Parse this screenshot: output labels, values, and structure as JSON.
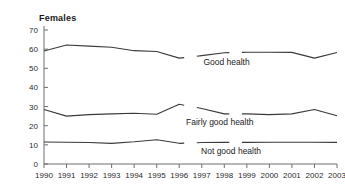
{
  "chart_data": {
    "type": "line",
    "title": "Females",
    "xlabel": "",
    "ylabel": "",
    "x": [
      1990,
      1991,
      1992,
      1993,
      1994,
      1995,
      1996,
      1997,
      1998,
      1999,
      2000,
      2001,
      2002,
      2003
    ],
    "categories": [
      "1990",
      "1991",
      "1992",
      "1993",
      "1994",
      "1995",
      "1996",
      "1997",
      "1998",
      "1999",
      "2000",
      "2001",
      "2002",
      "2003"
    ],
    "ylim": [
      0,
      70
    ],
    "yticks": [
      0,
      10,
      20,
      30,
      40,
      50,
      60,
      70
    ],
    "ytick_labels": [
      "0",
      "10",
      "20",
      "30",
      "40",
      "50",
      "60",
      "70"
    ],
    "grid": false,
    "legend_position": "inline-annotations",
    "series": [
      {
        "name": "Good health",
        "label": "Good health",
        "values": [
          59,
          62.2,
          61.6,
          61,
          59.2,
          58.8,
          55.3,
          56.6,
          58.1,
          58.4,
          58.4,
          58.3,
          55.3,
          58.2
        ],
        "breaks_after": [
          1996,
          1998
        ]
      },
      {
        "name": "Fairly good health",
        "label": "Fairly good health",
        "values": [
          28.5,
          25,
          25.8,
          26.2,
          26.5,
          26,
          31.2,
          29,
          26.2,
          26.2,
          25.8,
          26.2,
          28.5,
          25.2
        ],
        "breaks_after": [
          1996,
          1998
        ]
      },
      {
        "name": "Not good health",
        "label": "Not good health",
        "values": [
          11.5,
          11.4,
          11.2,
          10.8,
          11.6,
          12.7,
          10.8,
          11.2,
          11.3,
          11.3,
          11.4,
          11.4,
          11.4,
          11.3
        ],
        "breaks_after": [
          1996,
          1998
        ]
      }
    ],
    "annotations": [
      {
        "text": "Good health",
        "x": 1998.1,
        "y": 51.5
      },
      {
        "text": "Fairly good health",
        "x": 1997.8,
        "y": 20.2
      },
      {
        "text": "Not good health",
        "x": 1998.3,
        "y": 5.0
      }
    ],
    "colors": {
      "line": "#3a3a3a",
      "axis": "#6e6e6e",
      "text": "#1a1a1a",
      "background": "#ffffff"
    }
  }
}
